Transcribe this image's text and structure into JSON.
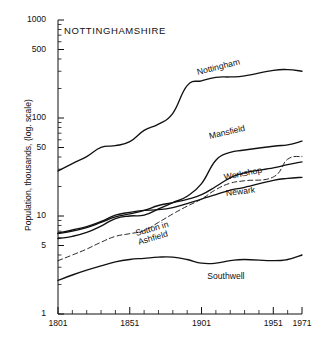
{
  "chart_data": {
    "type": "line",
    "title": "NOTTINGHAMSHIRE",
    "xlabel": "",
    "ylabel": "Population, thousands, (log. scale)",
    "x_ticks": [
      "1801",
      "1851",
      "1901",
      "1951",
      "1971"
    ],
    "x_tick_values": [
      1801,
      1851,
      1901,
      1951,
      1971
    ],
    "minor_x_ticks": [
      1811,
      1821,
      1831,
      1841,
      1861,
      1871,
      1881,
      1891,
      1911,
      1921,
      1931,
      1941,
      1961
    ],
    "xlim": [
      1801,
      1971
    ],
    "y_ticks": [
      "1000",
      "500",
      "100",
      "50",
      "10",
      "5",
      "1"
    ],
    "y_tick_values": [
      1000,
      500,
      100,
      50,
      10,
      5,
      1
    ],
    "ylim": [
      1,
      1000
    ],
    "y_scale": "log",
    "grid": false,
    "legend": "inline-labels",
    "x": [
      1801,
      1811,
      1821,
      1831,
      1841,
      1851,
      1861,
      1871,
      1881,
      1891,
      1901,
      1911,
      1921,
      1931,
      1951,
      1961,
      1971
    ],
    "series": [
      {
        "name": "Nottingham",
        "style": "solid",
        "label_x": 1898,
        "label_y": 330,
        "values": [
          28.8,
          34.3,
          40.4,
          50.2,
          52.2,
          57.4,
          74.7,
          86.6,
          111.6,
          213.9,
          239.7,
          259.9,
          262.6,
          268.8,
          306.0,
          311.6,
          300.0
        ]
      },
      {
        "name": "Mansfield",
        "style": "solid",
        "label_x": 1906,
        "label_y": 73,
        "values": [
          5.9,
          6.2,
          6.8,
          7.9,
          9.4,
          10.0,
          10.2,
          11.8,
          13.7,
          15.9,
          21.4,
          37.1,
          44.5,
          47.1,
          51.5,
          53.2,
          58.0
        ]
      },
      {
        "name": "Sutton in Ashfield",
        "style": "dashed",
        "label_x": 1856,
        "label_y": 7.3,
        "values": [
          3.5,
          4.0,
          4.6,
          5.4,
          6.2,
          6.6,
          7.1,
          8.6,
          10.5,
          12.6,
          14.9,
          18.6,
          21.6,
          22.9,
          25.0,
          38.0,
          40.4
        ]
      },
      {
        "name": "Workshop",
        "style": "solid",
        "label_x": 1917,
        "label_y": 28,
        "values": [
          6.6,
          7.0,
          7.6,
          8.6,
          9.8,
          10.5,
          11.4,
          12.8,
          13.7,
          14.8,
          16.5,
          20.0,
          24.5,
          27.6,
          31.0,
          33.5,
          35.7
        ]
      },
      {
        "name": "Newark",
        "style": "solid",
        "label_x": 1918,
        "label_y": 19.5,
        "values": [
          6.7,
          7.2,
          7.8,
          8.8,
          10.2,
          10.9,
          11.4,
          11.6,
          12.2,
          13.4,
          14.9,
          16.5,
          18.4,
          19.6,
          23.1,
          24.2,
          24.8
        ]
      },
      {
        "name": "Southwell",
        "style": "solid",
        "label_x": 1905,
        "label_y": 2.75,
        "values": [
          2.2,
          2.5,
          2.8,
          3.1,
          3.4,
          3.6,
          3.7,
          3.8,
          3.8,
          3.6,
          3.3,
          3.3,
          3.5,
          3.6,
          3.5,
          3.6,
          4.0
        ]
      }
    ]
  },
  "colors": {
    "ink": "#111111",
    "background": "#ffffff"
  }
}
